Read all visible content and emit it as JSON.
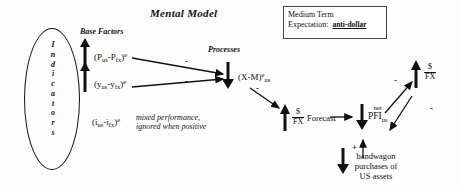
{
  "diagram": {
    "title": "Mental Model",
    "indicators_label": "Indicators",
    "indicators_letters": [
      "I",
      "n",
      "d",
      "i",
      "c",
      "a",
      "t",
      "o",
      "r",
      "s"
    ],
    "base_factors_heading": "Base Factors",
    "processes_heading": "Processes",
    "factor1": {
      "open": "(P",
      "sub1": "us",
      "minus": "-P",
      "sub2": "fx",
      "close": ")",
      "exp": "e"
    },
    "factor2": {
      "open": "(y",
      "sub1": "us",
      "minus": "-y",
      "sub2": "fx",
      "close": ")",
      "exp": "e"
    },
    "factor3": {
      "open": "(i",
      "sub1": "us",
      "minus": "-i",
      "sub2": "fx",
      "close": ")",
      "exp": "e"
    },
    "factor3_note_line1": "mixed performance,",
    "factor3_note_line2": "ignored when positive",
    "process_net_exports": {
      "open": "(X-M)",
      "exp": "e",
      "sub": "us"
    },
    "fx_rate_num": "$",
    "fx_rate_den": "FX",
    "forecast_label": "Forecast",
    "net_pfi_small": "net",
    "net_pfi_big": "PFI",
    "net_pfi_sub": "us",
    "bandwagon_line1": "bandwagon",
    "bandwagon_line2": "purchases of",
    "bandwagon_line3": "US assets",
    "sign_minus": "-",
    "sign_plus": "+"
  },
  "medium_term": {
    "line1": "Medium Term",
    "line2": "Expectation:",
    "value": "anti-dollar"
  },
  "colors": {
    "ink": "#111111",
    "box_border": "#444444",
    "background": "#fdfdfd"
  }
}
